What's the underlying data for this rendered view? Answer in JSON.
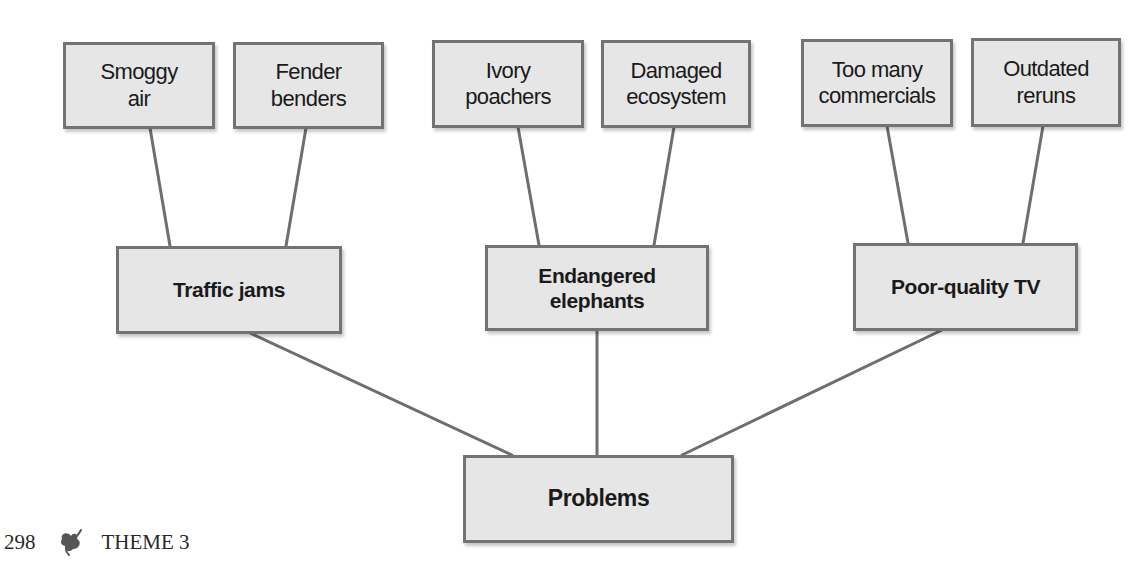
{
  "diagram": {
    "type": "tree",
    "root": {
      "label": "Problems"
    },
    "branches": [
      {
        "label_lines": [
          "Traffic jams"
        ],
        "leaves": [
          {
            "lines": [
              "Smoggy",
              "air"
            ]
          },
          {
            "lines": [
              "Fender",
              "benders"
            ]
          }
        ]
      },
      {
        "label_lines": [
          "Endangered",
          "elephants"
        ],
        "leaves": [
          {
            "lines": [
              "Ivory",
              "poachers"
            ]
          },
          {
            "lines": [
              "Damaged",
              "ecosystem"
            ]
          }
        ]
      },
      {
        "label_lines": [
          "Poor-quality TV"
        ],
        "leaves": [
          {
            "lines": [
              "Too many",
              "commercials"
            ]
          },
          {
            "lines": [
              "Outdated",
              "reruns"
            ]
          }
        ]
      }
    ],
    "colors": {
      "box_fill": "#e6e6e6",
      "box_border": "#737373",
      "line": "#6e6e6e",
      "text": "#1a1a1a"
    }
  },
  "footer": {
    "page_number": "298",
    "icon": "leaf-swirl-icon",
    "section": "THEME 3"
  }
}
